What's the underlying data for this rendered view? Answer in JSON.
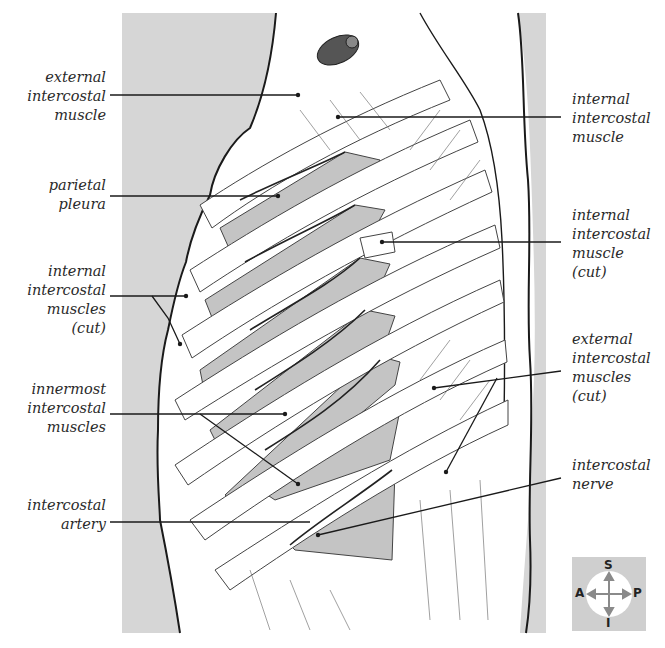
{
  "figure": {
    "type": "anatomical-illustration",
    "colors": {
      "background_panel": "#d6d6d6",
      "body_fill": "#ffffff",
      "intercostal_space": "#c4c4c4",
      "outline": "#1a1a1a",
      "detail_line": "#555555",
      "label_text": "#2a2a2a"
    }
  },
  "labels": {
    "left": [
      {
        "id": "external-intercostal-muscle",
        "text": "external\nintercostal\nmuscle"
      },
      {
        "id": "parietal-pleura",
        "text": "parietal\npleura"
      },
      {
        "id": "internal-intercostal-muscles-cut",
        "text": "internal\nintercostal\nmuscles\n(cut)"
      },
      {
        "id": "innermost-intercostal-muscles",
        "text": "innermost\nintercostal\nmuscles"
      },
      {
        "id": "intercostal-artery",
        "text": "intercostal\nartery"
      }
    ],
    "right": [
      {
        "id": "internal-intercostal-muscle",
        "text": "internal\nintercostal\nmuscle"
      },
      {
        "id": "internal-intercostal-muscle-cut",
        "text": "internal\nintercostal\nmuscle\n(cut)"
      },
      {
        "id": "external-intercostal-muscles-cut",
        "text": "external\nintercostal\nmuscles\n(cut)"
      },
      {
        "id": "intercostal-nerve",
        "text": "intercostal\nnerve"
      }
    ]
  },
  "orientation_compass": {
    "superior": "S",
    "inferior": "I",
    "anterior": "A",
    "posterior": "P"
  }
}
